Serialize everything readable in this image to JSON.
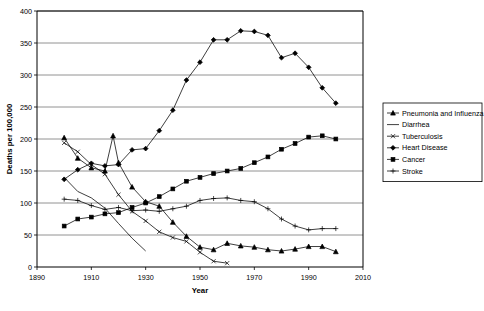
{
  "chart_data": {
    "type": "line",
    "title": "",
    "xlabel": "Year",
    "ylabel": "Deaths per 100,000",
    "xlim": [
      1890,
      2010
    ],
    "ylim": [
      0,
      400
    ],
    "xticks": [
      1890,
      1910,
      1930,
      1950,
      1970,
      1990,
      2010
    ],
    "yticks": [
      0,
      50,
      100,
      150,
      200,
      250,
      300,
      350,
      400
    ],
    "grid": "horizontal",
    "legend_position": "right",
    "series": [
      {
        "name": "Pneumonia and Influenza",
        "marker": "triangle",
        "x": [
          1900,
          1905,
          1910,
          1915,
          1918,
          1920,
          1925,
          1930,
          1935,
          1940,
          1945,
          1950,
          1955,
          1960,
          1965,
          1970,
          1975,
          1980,
          1985,
          1990,
          1995,
          2000
        ],
        "y": [
          202,
          170,
          155,
          150,
          205,
          163,
          125,
          102,
          95,
          70,
          48,
          31,
          27,
          37,
          33,
          31,
          27,
          25,
          28,
          32,
          32,
          24
        ]
      },
      {
        "name": "Diarrhea",
        "marker": "none",
        "x": [
          1900,
          1905,
          1910,
          1915,
          1920,
          1925,
          1930
        ],
        "y": [
          140,
          118,
          108,
          92,
          68,
          45,
          25
        ]
      },
      {
        "name": "Tuberculosis",
        "marker": "x",
        "x": [
          1900,
          1905,
          1910,
          1915,
          1920,
          1925,
          1930,
          1935,
          1940,
          1945,
          1950,
          1955,
          1960
        ],
        "y": [
          194,
          180,
          160,
          145,
          113,
          87,
          72,
          55,
          46,
          40,
          23,
          9,
          6
        ]
      },
      {
        "name": "Heart Disease",
        "marker": "diamond",
        "x": [
          1900,
          1905,
          1910,
          1915,
          1920,
          1925,
          1930,
          1935,
          1940,
          1945,
          1950,
          1955,
          1960,
          1965,
          1970,
          1975,
          1980,
          1985,
          1990,
          1995,
          2000
        ],
        "y": [
          137,
          152,
          162,
          158,
          160,
          183,
          185,
          213,
          245,
          292,
          320,
          355,
          355,
          369,
          368,
          362,
          327,
          334,
          312,
          280,
          256
        ]
      },
      {
        "name": "Cancer",
        "marker": "square",
        "x": [
          1900,
          1905,
          1910,
          1915,
          1920,
          1925,
          1930,
          1935,
          1940,
          1945,
          1950,
          1955,
          1960,
          1965,
          1970,
          1975,
          1980,
          1985,
          1990,
          1995,
          2000
        ],
        "y": [
          64,
          75,
          78,
          83,
          85,
          93,
          100,
          110,
          122,
          134,
          140,
          146,
          150,
          154,
          163,
          172,
          184,
          193,
          203,
          205,
          200
        ]
      },
      {
        "name": "Stroke",
        "marker": "plus",
        "x": [
          1900,
          1905,
          1910,
          1915,
          1920,
          1925,
          1930,
          1935,
          1940,
          1945,
          1950,
          1955,
          1960,
          1965,
          1970,
          1975,
          1980,
          1985,
          1990,
          1995,
          2000
        ],
        "y": [
          106,
          104,
          96,
          90,
          93,
          88,
          89,
          87,
          91,
          95,
          104,
          107,
          108,
          104,
          102,
          91,
          75,
          64,
          58,
          60,
          60
        ]
      }
    ]
  }
}
